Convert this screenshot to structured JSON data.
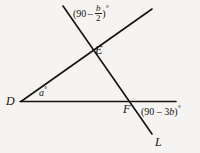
{
  "figure": {
    "type": "geometry-diagram",
    "background_color": "#f5f4f2",
    "line_color": "#14130f",
    "points": {
      "D": "D",
      "E": "E",
      "F": "F",
      "L": "L"
    },
    "angle_labels": {
      "at_D": {
        "text": "a",
        "degree": "°"
      },
      "at_E_top": {
        "open_paren": "(",
        "constant": "90",
        "operator": "–",
        "fraction_numerator": "b",
        "fraction_denominator": "2",
        "close_paren": ")",
        "degree": "°"
      },
      "at_F_right": {
        "prefix": "(90 – 3",
        "variable": "b",
        "suffix": ")",
        "degree": "°"
      }
    },
    "lines": [
      {
        "name": "horizontal-line",
        "x1": 20,
        "y1": 101.5,
        "x2": 176,
        "y2": 101.5
      },
      {
        "name": "ray-from-D-through-E",
        "x1": 21,
        "y1": 101.5,
        "x2": 152,
        "y2": 9
      },
      {
        "name": "line-through-E-F-to-L",
        "x1": 63,
        "y1": 6,
        "x2": 152,
        "y2": 134
      }
    ]
  }
}
